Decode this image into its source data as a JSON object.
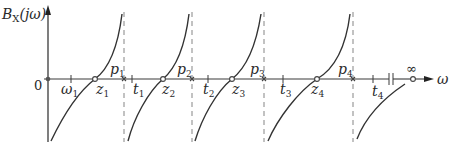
{
  "diagram": {
    "y_axis_label": {
      "main": "B",
      "sub": "X",
      "arg": "(jω)"
    },
    "x_axis_label": "ω",
    "origin_label": "0",
    "infinity_label": "∞",
    "axis_color": "#3a3a3a",
    "curve_color": "#333333",
    "dashed_color": "#9a9a9a",
    "ticks": [
      {
        "name": "omega1",
        "base": "ω",
        "sub": "1",
        "x": 71
      },
      {
        "name": "t1",
        "base": "t",
        "sub": "1",
        "x": 132
      },
      {
        "name": "t2",
        "base": "t",
        "sub": "2",
        "x": 208
      },
      {
        "name": "t3",
        "base": "t",
        "sub": "3",
        "x": 283
      },
      {
        "name": "t4",
        "base": "t",
        "sub": "4",
        "x": 373
      }
    ],
    "zeros": [
      {
        "base": "z",
        "sub": "1",
        "x": 95
      },
      {
        "base": "z",
        "sub": "2",
        "x": 163
      },
      {
        "base": "z",
        "sub": "3",
        "x": 232
      },
      {
        "base": "z",
        "sub": "4",
        "x": 317
      }
    ],
    "poles": [
      {
        "base": "p",
        "sub": "1",
        "x": 124
      },
      {
        "base": "p",
        "sub": "2",
        "x": 192
      },
      {
        "base": "p",
        "sub": "3",
        "x": 264
      },
      {
        "base": "p",
        "sub": "4",
        "x": 353
      }
    ]
  }
}
